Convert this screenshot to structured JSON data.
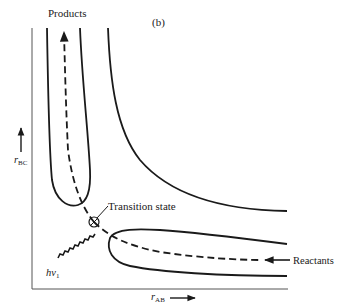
{
  "figure": {
    "panel_label": "(b)",
    "top_label": "Products",
    "right_label": "Reactants",
    "annotation": "Transition state",
    "photon_label_main": "hν",
    "photon_label_sub": "1",
    "x_axis": {
      "main": "r",
      "sub": "AB"
    },
    "y_axis": {
      "main": "r",
      "sub": "BC"
    }
  },
  "colors": {
    "ink": "#1a1a1a",
    "background": "#ffffff"
  }
}
